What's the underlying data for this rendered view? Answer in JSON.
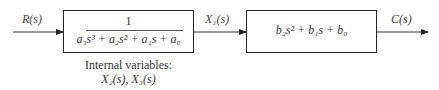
{
  "diagram": {
    "type": "block_diagram",
    "input_signal": "R(s)",
    "intermediate_signal": "X₁(s)",
    "output_signal": "C(s)",
    "block1": {
      "numerator": "1",
      "denominator": "a₃s³ + a₂s² + a₁s + a₀"
    },
    "block2": {
      "expression": "b₂s² + b₁s + b₀"
    },
    "note": {
      "line1": "Internal variables:",
      "line2": "X₂(s), X₃(s)"
    }
  }
}
